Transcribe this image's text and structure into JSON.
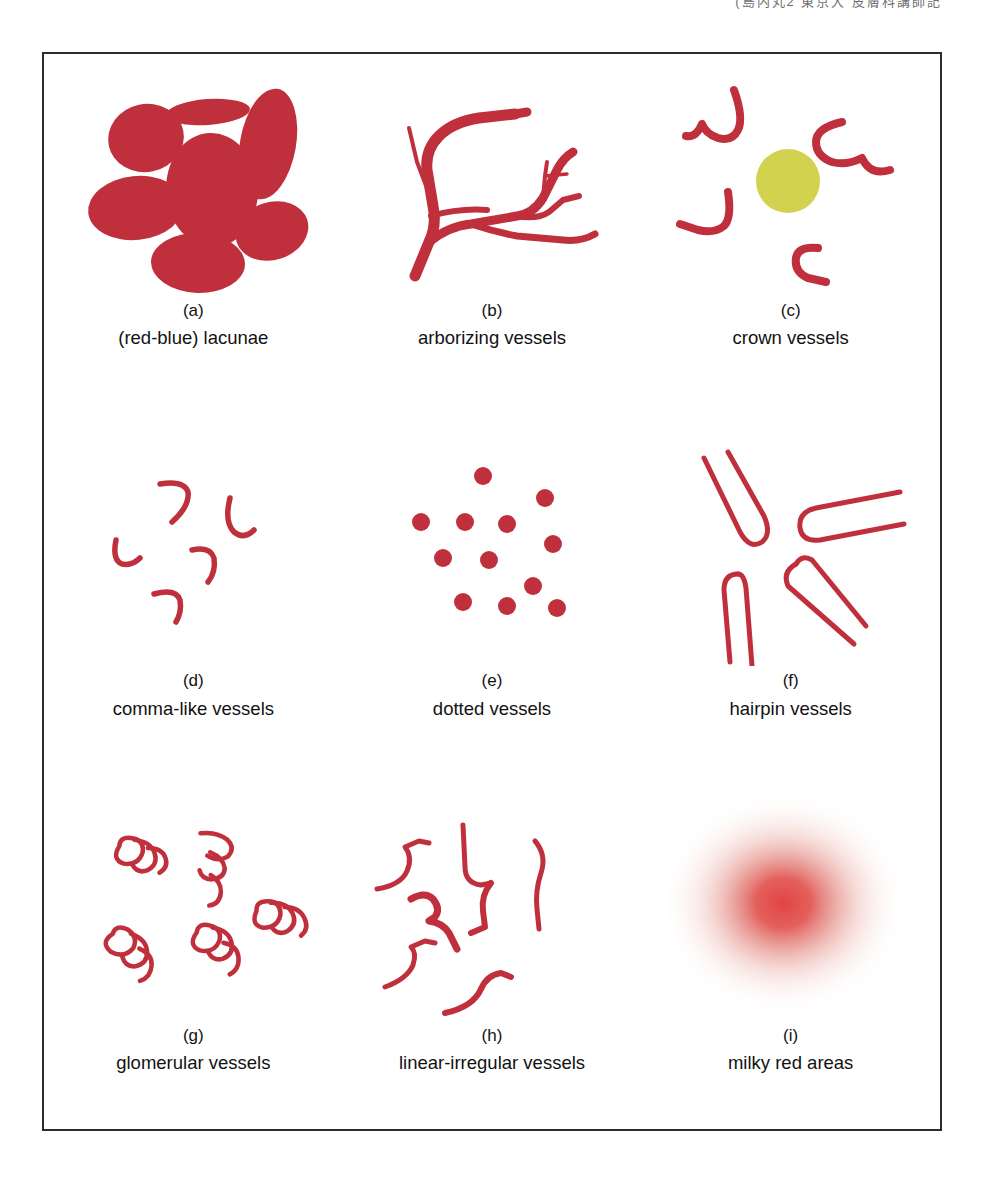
{
  "figure": {
    "top_caption": "(島内丸2  東京大  皮膚科講師記",
    "border_color": "#2b2b2b",
    "background": "#ffffff"
  },
  "colors": {
    "vessel_red": "#c0303c",
    "vessel_red_light": "#c8404a",
    "lacuna_fill": "#c0303c",
    "crown_center_yellow": "#d3d24e",
    "milky_red_core": "#e03a38",
    "text": "#121212"
  },
  "panels": [
    {
      "letter": "(a)",
      "label": "(red-blue) lacunae",
      "art": "lacunae",
      "description": "seven solid red ellipses of varying size and rotation packed in a cluster",
      "count": 7
    },
    {
      "letter": "(b)",
      "label": "arborizing vessels",
      "art": "arborizing",
      "description": "thick trunk vessels branching into progressively thinner tree-like limbs",
      "count": 1
    },
    {
      "letter": "(c)",
      "label": "crown vessels",
      "art": "crown",
      "description": "four curved hook vessels radiating around a central yellow-olive circle",
      "count": 4
    },
    {
      "letter": "(d)",
      "label": "comma-like vessels",
      "art": "comma",
      "description": "five short thin comma or hook shaped vessel marks scattered apart",
      "count": 5
    },
    {
      "letter": "(e)",
      "label": "dotted vessels",
      "art": "dotted",
      "description": "thirteen small solid red dots in a loose irregular cluster",
      "count": 13
    },
    {
      "letter": "(f)",
      "label": "hairpin vessels",
      "art": "hairpin",
      "description": "four elongated open ended U shaped hairpin loops at varied angles",
      "count": 4
    },
    {
      "letter": "(g)",
      "label": "glomerular vessels",
      "art": "glomerular",
      "description": "five tightly coiled tangled ball-like vessel clumps",
      "count": 5
    },
    {
      "letter": "(h)",
      "label": "linear-irregular vessels",
      "art": "linear-irregular",
      "description": "several irregular zigzag and wavy unconnected line segments",
      "count": 7
    },
    {
      "letter": "(i)",
      "label": "milky red areas",
      "art": "milky-red",
      "description": "soft blurred radial red blush fading outward into white",
      "count": 1
    }
  ]
}
